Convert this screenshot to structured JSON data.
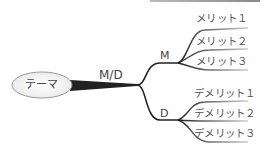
{
  "diagram": {
    "type": "mind-map",
    "root": {
      "label": "テーマ"
    },
    "trunk": {
      "label": "M/D"
    },
    "branches": [
      {
        "label": "M",
        "children": [
          "メリット１",
          "メリット２",
          "メリット３"
        ]
      },
      {
        "label": "D",
        "children": [
          "デメリット１",
          "デメリット２",
          "デメリット３"
        ]
      }
    ]
  },
  "colors": {
    "line": "#222222",
    "text": "#444444",
    "ellipse_fill": "#f4f4f4",
    "ellipse_stroke": "#999999"
  }
}
